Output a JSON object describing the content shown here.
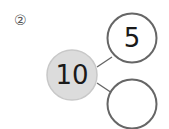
{
  "problem": {
    "label": "②",
    "whole": {
      "value": "10",
      "fill": "#dcdcdc",
      "stroke": "#c4c4c4"
    },
    "parts": [
      {
        "value": "5"
      },
      {
        "value": ""
      }
    ],
    "stroke_color": "#666666"
  }
}
